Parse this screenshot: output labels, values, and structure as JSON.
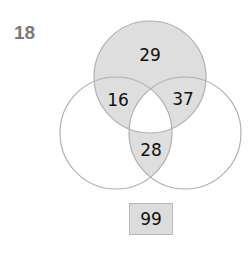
{
  "question_number": "18",
  "venn": {
    "sets": [
      "top",
      "left",
      "right"
    ],
    "regions": {
      "top_only": "29",
      "top_left": "16",
      "top_right": "37",
      "left_right": "28"
    },
    "shaded_regions": [
      "top_only",
      "top_left",
      "top_right",
      "left_right"
    ],
    "unshaded_regions": [
      "left_only",
      "right_only",
      "all_three"
    ],
    "colors": {
      "shade": "#dedede",
      "stroke": "#b0b0b0"
    }
  },
  "total": "99"
}
